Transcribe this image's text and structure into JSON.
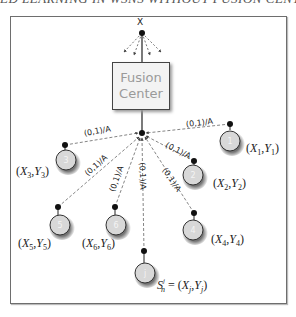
{
  "header_cut_text": "ED LEARNING IN WSNS WITHOUT FUSION CENTER",
  "global_node_label": "X",
  "fusion_center": {
    "line1": "Fusion",
    "line2": "Center"
  },
  "edge_label": "(0,1)/A",
  "nodes": [
    {
      "id": "1",
      "coord": "(X1,Y1)",
      "x_sub": "1",
      "y_sub": "1"
    },
    {
      "id": "2",
      "coord": "(X2,Y2)",
      "x_sub": "2",
      "y_sub": "2"
    },
    {
      "id": "3",
      "coord": "(X3,Y3)",
      "x_sub": "3",
      "y_sub": "3"
    },
    {
      "id": "4",
      "coord": "(X4,Y4)",
      "x_sub": "4",
      "y_sub": "4"
    },
    {
      "id": "5",
      "coord": "(X5,Y5)",
      "x_sub": "5",
      "y_sub": "5"
    },
    {
      "id": "6",
      "coord": "(X6,Y6)",
      "x_sub": "6",
      "y_sub": "6"
    },
    {
      "id": "j",
      "coord": "S_n^j = (X_j,Y_j)",
      "x_sub": "j",
      "y_sub": "j"
    }
  ],
  "node_j_label": {
    "S": "S",
    "sub": "n",
    "sup": "j",
    "eq": " = (",
    "X": "X",
    "comma": ",",
    "Y": "Y",
    "close": ")"
  },
  "colors": {
    "node_fill": "#d8d8d8",
    "node_stroke": "#333333",
    "edge": "#555555",
    "frame": "#6e6e6e"
  }
}
